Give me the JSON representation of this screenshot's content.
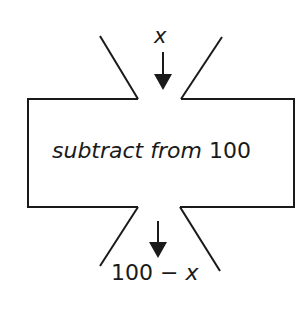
{
  "diagram": {
    "type": "function-machine",
    "input": {
      "label": "x"
    },
    "machine": {
      "label_italic": "subtract from",
      "label_plain": " 100"
    },
    "output": {
      "label_plain": "100 − ",
      "label_italic": "x"
    },
    "colors": {
      "stroke": "#1a1a1a",
      "background": "#ffffff"
    }
  }
}
